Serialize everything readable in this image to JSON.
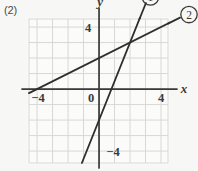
{
  "problem": {
    "label": "(2)"
  },
  "chart_data": {
    "type": "line",
    "title": "",
    "xlabel": "x",
    "ylabel": "y",
    "xlim": [
      -4.52,
      4.45
    ],
    "ylim": [
      -4.77,
      4.52
    ],
    "grid": true,
    "grid_step": 1,
    "legend": "inline-callout",
    "x_ticks": [
      {
        "value": -4,
        "label": "−4"
      },
      {
        "value": 0,
        "label": "0"
      },
      {
        "value": 4,
        "label": "4"
      }
    ],
    "y_ticks": [
      {
        "value": 4,
        "label": "4"
      },
      {
        "value": -4,
        "label": "−4"
      }
    ],
    "series": [
      {
        "name": "①",
        "callout": "1",
        "slope": 2.5,
        "intercept": -2,
        "x_intercept": 0.8,
        "points": [
          [
            -1.12,
            -4.8
          ],
          [
            2.0,
            3.0
          ],
          [
            2.6,
            4.5
          ]
        ]
      },
      {
        "name": "②",
        "callout": "2",
        "slope": 0.5,
        "intercept": 2,
        "x_intercept": -4,
        "points": [
          [
            -4.5,
            -0.25
          ],
          [
            0,
            2.0
          ],
          [
            2.0,
            3.0
          ],
          [
            4.45,
            4.22
          ]
        ]
      }
    ],
    "annotations": [
      {
        "text": "y",
        "role": "y-axis-label"
      },
      {
        "text": "x",
        "role": "x-axis-label"
      },
      {
        "text": "①",
        "role": "series-1-callout"
      },
      {
        "text": "②",
        "role": "series-2-callout"
      }
    ],
    "colors": {
      "background": "#f7f7f5",
      "grid": "#d8d8d6",
      "axis": "#3a3a3a",
      "line": "#2e2e2e",
      "text": "#3a3a3a"
    }
  }
}
